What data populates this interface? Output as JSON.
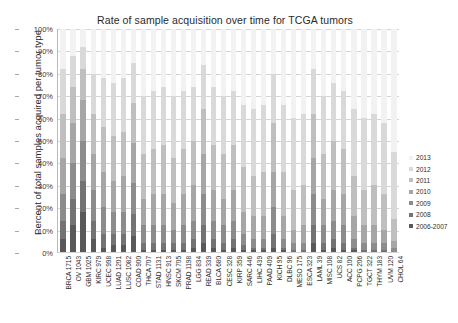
{
  "chart_data": {
    "type": "bar",
    "subtype": "stacked-100-percent",
    "title": "Rate of sample acquisition over time for TCGA tumors",
    "xlabel": "",
    "ylabel": "Percent of total samples acquired per tumor type",
    "ylim": [
      0,
      100
    ],
    "ytick_labels": [
      "100%",
      "90%",
      "80%",
      "70%",
      "60%",
      "50%",
      "40%",
      "30%",
      "20%",
      "10%",
      "0%"
    ],
    "ytick_values": [
      100,
      90,
      80,
      70,
      60,
      50,
      40,
      30,
      20,
      10,
      0
    ],
    "grid": true,
    "legend_position": "right",
    "legend_entries": [
      "2013",
      "2012",
      "2011",
      "2010",
      "2009",
      "2008",
      "2006-2007"
    ],
    "series_colors": {
      "2013": "#f2f2f2",
      "2012": "#d9d9d9",
      "2011": "#bfbfbf",
      "2010": "#a6a6a6",
      "2009": "#8c8c8c",
      "2008": "#737373",
      "2006-2007": "#595959"
    },
    "categories": [
      "BRCA 1715",
      "OV 1043",
      "GBM 1025",
      "KIRC 979",
      "UCEC 998",
      "LUAD 1201",
      "LUSC 1082",
      "COAD 900",
      "THCA 707",
      "STAD 1131",
      "HNSC 913",
      "SKCM 705",
      "PRAD 1198",
      "LGG 834",
      "READ 339",
      "BLCA 680",
      "CESC 328",
      "KIRP 359",
      "SARC 446",
      "LIHC 439",
      "PAAD 409",
      "KICH 95",
      "DLBC 96",
      "MESO 175",
      "ESCA 323",
      "LAML 39",
      "MISC 108",
      "UCS 82",
      "ACC 100",
      "PCPG 206",
      "TGCT 322",
      "THYM 183",
      "UVM 120",
      "CHOL 64"
    ],
    "series": [
      {
        "name": "2013",
        "values": [
          18,
          12,
          8,
          20,
          22,
          24,
          22,
          15,
          30,
          28,
          26,
          30,
          28,
          26,
          16,
          26,
          30,
          28,
          34,
          36,
          34,
          20,
          34,
          40,
          38,
          18,
          30,
          24,
          28,
          36,
          40,
          38,
          42,
          55
        ]
      },
      {
        "name": "2012",
        "values": [
          20,
          14,
          10,
          18,
          22,
          24,
          24,
          18,
          26,
          26,
          26,
          28,
          26,
          24,
          20,
          26,
          26,
          24,
          28,
          30,
          30,
          22,
          30,
          32,
          32,
          20,
          26,
          26,
          26,
          30,
          32,
          32,
          32,
          30
        ]
      },
      {
        "name": "2011",
        "values": [
          20,
          16,
          14,
          18,
          20,
          20,
          20,
          18,
          20,
          20,
          22,
          20,
          20,
          20,
          20,
          20,
          20,
          20,
          20,
          18,
          20,
          22,
          20,
          18,
          18,
          20,
          20,
          22,
          20,
          18,
          16,
          18,
          16,
          10
        ]
      },
      {
        "name": "2010",
        "values": [
          16,
          18,
          18,
          16,
          16,
          14,
          16,
          18,
          12,
          14,
          14,
          12,
          14,
          16,
          18,
          14,
          12,
          14,
          10,
          10,
          10,
          16,
          10,
          6,
          8,
          16,
          12,
          14,
          14,
          10,
          8,
          8,
          6,
          3
        ]
      },
      {
        "name": "2009",
        "values": [
          12,
          16,
          18,
          14,
          12,
          10,
          10,
          14,
          8,
          8,
          8,
          6,
          8,
          8,
          14,
          8,
          8,
          8,
          5,
          4,
          4,
          12,
          4,
          3,
          3,
          14,
          8,
          8,
          8,
          4,
          3,
          3,
          3,
          2
        ]
      },
      {
        "name": "2008",
        "values": [
          8,
          12,
          14,
          8,
          6,
          5,
          5,
          10,
          3,
          3,
          3,
          3,
          3,
          4,
          8,
          4,
          3,
          4,
          2,
          1,
          1,
          6,
          1,
          1,
          1,
          8,
          3,
          4,
          3,
          1,
          1,
          1,
          1,
          0
        ]
      },
      {
        "name": "2006-2007",
        "values": [
          6,
          12,
          18,
          6,
          2,
          3,
          3,
          7,
          1,
          1,
          1,
          1,
          1,
          2,
          4,
          2,
          1,
          2,
          1,
          1,
          1,
          2,
          1,
          0,
          0,
          4,
          1,
          2,
          1,
          1,
          0,
          0,
          0,
          0
        ]
      }
    ]
  }
}
